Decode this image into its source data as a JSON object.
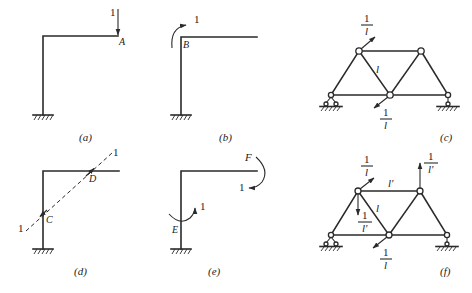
{
  "figure": {
    "panels": [
      {
        "id": "a",
        "caption": "(a)",
        "structure": "cantilever L-frame",
        "load_label": "1",
        "point_label": "A",
        "load_type": "vertical unit force"
      },
      {
        "id": "b",
        "caption": "(b)",
        "structure": "cantilever L-frame",
        "load_label": "1",
        "point_label": "B",
        "load_type": "unit moment"
      },
      {
        "id": "c",
        "caption": "(c)",
        "structure": "truss",
        "member_label": "l",
        "load_top": {
          "num": "1",
          "den": "l"
        },
        "load_bottom": {
          "num": "1",
          "den": "l"
        }
      },
      {
        "id": "d",
        "caption": "(d)",
        "structure": "cantilever L-frame",
        "load_label_top": "1",
        "load_label_bottom": "1",
        "point_labels": [
          "D",
          "C"
        ],
        "load_type": "pair of collinear unit forces"
      },
      {
        "id": "e",
        "caption": "(e)",
        "structure": "cantilever L-frame",
        "load_label_f": "1",
        "load_label_e": "1",
        "point_labels": [
          "F",
          "E"
        ],
        "load_type": "pair of unit moments"
      },
      {
        "id": "f",
        "caption": "(f)",
        "structure": "truss",
        "member_label_top": "l'",
        "member_label_diag": "l",
        "load_top_left": {
          "num": "1",
          "den": "l"
        },
        "load_top_right": {
          "num": "1",
          "den": "l'"
        },
        "load_mid": {
          "num": "1",
          "den": "l'"
        },
        "load_bottom": {
          "num": "1",
          "den": "l"
        }
      }
    ]
  }
}
